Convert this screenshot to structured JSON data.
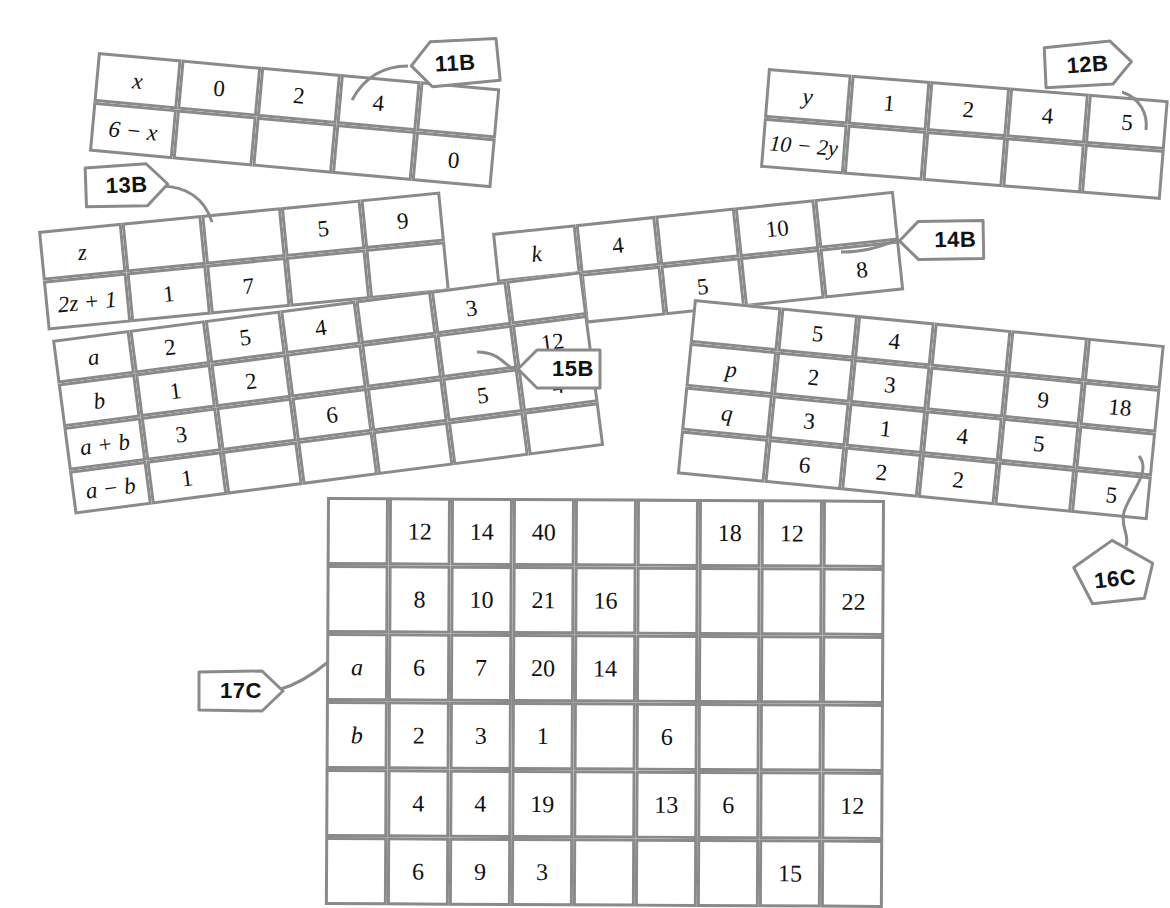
{
  "page": {
    "background": "#ffffff",
    "line_color": "#8a8a8a",
    "text_color": "#111111"
  },
  "tables": [
    {
      "id": "11B",
      "tag": "11B",
      "rows": 2,
      "cols": 5,
      "cells": [
        [
          "x",
          "0",
          "2",
          "4",
          ""
        ],
        [
          "6 − x",
          "",
          "",
          "",
          "0"
        ]
      ]
    },
    {
      "id": "12B",
      "tag": "12B",
      "rows": 2,
      "cols": 5,
      "cells": [
        [
          "y",
          "1",
          "2",
          "4",
          "5"
        ],
        [
          "10 − 2y",
          "",
          "",
          "",
          ""
        ]
      ]
    },
    {
      "id": "13B",
      "tag": "13B",
      "rows": 2,
      "cols": 5,
      "cells": [
        [
          "z",
          "",
          "",
          "5",
          "9"
        ],
        [
          "2z + 1",
          "1",
          "7",
          "",
          ""
        ]
      ]
    },
    {
      "id": "14B",
      "tag": "14B",
      "rows": 2,
      "cols": 5,
      "cells": [
        [
          "k",
          "4",
          "",
          "10",
          ""
        ],
        [
          "3k − 1",
          "",
          "5",
          "",
          "8"
        ]
      ]
    },
    {
      "id": "15B",
      "tag": "15B",
      "rows": 4,
      "cols": 6,
      "cells": [
        [
          "a",
          "2",
          "5",
          "4",
          "",
          "3"
        ],
        [
          "b",
          "1",
          "2",
          "",
          "",
          ""
        ],
        [
          "a + b",
          "3",
          "",
          "6",
          "",
          "5"
        ],
        [
          "a − b",
          "1",
          "",
          "",
          "",
          ""
        ]
      ],
      "cells_extra_col": [
        "",
        "12",
        "4",
        ""
      ]
    },
    {
      "id": "16C",
      "tag": "16C",
      "rows": 4,
      "cols": 6,
      "cells": [
        [
          "",
          "5",
          "4",
          "",
          "",
          ""
        ],
        [
          "p",
          "2",
          "3",
          "",
          "9",
          "18"
        ],
        [
          "q",
          "3",
          "1",
          "4",
          "5",
          ""
        ],
        [
          "",
          "6",
          "2",
          "2",
          "",
          "5"
        ]
      ]
    },
    {
      "id": "17C",
      "tag": "17C",
      "rows": 6,
      "cols": 9,
      "cells": [
        [
          "",
          "12",
          "14",
          "40",
          "",
          "",
          "18",
          "12",
          ""
        ],
        [
          "",
          "8",
          "10",
          "21",
          "16",
          "",
          "",
          "",
          "22"
        ],
        [
          "a",
          "6",
          "7",
          "20",
          "14",
          "",
          "",
          "",
          ""
        ],
        [
          "b",
          "2",
          "3",
          "1",
          "",
          "6",
          "",
          "",
          ""
        ],
        [
          "",
          "4",
          "4",
          "19",
          "",
          "13",
          "6",
          "",
          "12"
        ],
        [
          "",
          "6",
          "9",
          "3",
          "",
          "",
          "",
          "15",
          ""
        ]
      ]
    }
  ],
  "tags": [
    {
      "label": "11B"
    },
    {
      "label": "12B"
    },
    {
      "label": "13B"
    },
    {
      "label": "14B"
    },
    {
      "label": "15B"
    },
    {
      "label": "16C"
    },
    {
      "label": "17C"
    }
  ]
}
